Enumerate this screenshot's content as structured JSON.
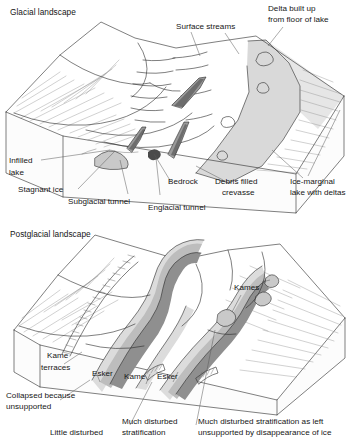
{
  "figure": {
    "caption_present": false,
    "panels": [
      {
        "id": "glacial",
        "title": "Glacial landscape",
        "labels": [
          {
            "name": "surface-streams",
            "lines": [
              "Surface streams"
            ]
          },
          {
            "name": "delta-built-up",
            "lines": [
              "Delta built up",
              "from floor of lake"
            ]
          },
          {
            "name": "infilled-lake",
            "lines": [
              "Infilled",
              "lake"
            ]
          },
          {
            "name": "stagnant-ice",
            "lines": [
              "Stagnant ice"
            ]
          },
          {
            "name": "subglacial-tunnel",
            "lines": [
              "Subglacial tunnel"
            ]
          },
          {
            "name": "englacial-tunnel",
            "lines": [
              "Englacial tunnel"
            ]
          },
          {
            "name": "bedrock",
            "lines": [
              "Bedrock"
            ]
          },
          {
            "name": "debris-filled-crevasse",
            "lines": [
              "Debris filled",
              "crevasse"
            ]
          },
          {
            "name": "ice-marginal-lake",
            "lines": [
              "Ice-marginal",
              "lake with deltas"
            ]
          }
        ]
      },
      {
        "id": "postglacial",
        "title": "Postglacial landscape",
        "labels": [
          {
            "name": "kames",
            "lines": [
              "Kames"
            ]
          },
          {
            "name": "kame-terraces",
            "lines": [
              "Kame",
              "terraces"
            ]
          },
          {
            "name": "esker-left",
            "lines": [
              "Esker"
            ]
          },
          {
            "name": "kame",
            "lines": [
              "Kame"
            ]
          },
          {
            "name": "esker-right",
            "lines": [
              "Esker"
            ]
          },
          {
            "name": "collapsed-unsupported",
            "lines": [
              "Collapsed because",
              "unsupported"
            ]
          },
          {
            "name": "little-disturbed",
            "lines": [
              "Little disturbed"
            ]
          },
          {
            "name": "much-disturbed-stratification",
            "lines": [
              "Much disturbed",
              "stratification"
            ]
          },
          {
            "name": "much-disturbed-as-left",
            "lines": [
              "Much disturbed stratification as left",
              "unsupported by disappearance of ice"
            ]
          }
        ]
      }
    ]
  },
  "text": {
    "glacial_landscape": "Glacial landscape",
    "surface_streams": "Surface streams",
    "delta_built_up_l1": "Delta built up",
    "delta_built_up_l2": "from floor of lake",
    "infilled_l1": "Infilled",
    "infilled_l2": "lake",
    "stagnant_ice": "Stagnant ice",
    "subglacial_tunnel": "Subglacial tunnel",
    "englacial_tunnel": "Englacial tunnel",
    "bedrock": "Bedrock",
    "debris_filled_l1": "Debris filled",
    "debris_filled_l2": "crevasse",
    "ice_marginal_l1": "Ice-marginal",
    "ice_marginal_l2": "lake with deltas",
    "postglacial_landscape": "Postglacial landscape",
    "kames": "Kames",
    "kame_terraces_l1": "Kame",
    "kame_terraces_l2": "terraces",
    "esker_left": "Esker",
    "kame": "Kame",
    "esker_right": "Esker",
    "collapsed_l1": "Collapsed because",
    "collapsed_l2": "unsupported",
    "little_disturbed": "Little disturbed",
    "much_disturbed_l1": "Much disturbed",
    "much_disturbed_l2": "stratification",
    "much_disturbed_left_l1": "Much disturbed stratification as left",
    "much_disturbed_left_l2": "unsupported by disappearance of ice"
  },
  "colors": {
    "ink": "#1e1e1e",
    "label_text": "#161616",
    "leader_line": "#585858",
    "hatch": "#8c8c8c",
    "lake_fill": "#d9d9d9",
    "esker_dark": "#8f8f8f",
    "esker_mid": "#bdbdbd",
    "esker_light": "#dcdcdc",
    "crevasse_dark": "#6d6d6d",
    "bedrock": "#4a4a4a",
    "background": "#ffffff"
  }
}
